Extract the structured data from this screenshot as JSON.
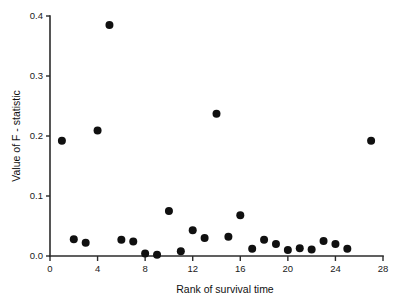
{
  "chart_data": {
    "type": "scatter",
    "title": "",
    "xlabel": "Rank of survival time",
    "ylabel": "Value of F - statistic",
    "xlim": [
      0,
      28
    ],
    "ylim": [
      0.0,
      0.4
    ],
    "xticks": [
      0,
      4,
      8,
      12,
      16,
      20,
      24,
      28
    ],
    "xtick_labels": [
      "0",
      "4",
      "8",
      "12",
      "16",
      "20",
      "24",
      "28"
    ],
    "yticks": [
      0.0,
      0.1,
      0.2,
      0.3,
      0.4
    ],
    "ytick_labels": [
      "0.0",
      "0.1",
      "0.2",
      "0.3",
      "0.4"
    ],
    "grid": false,
    "legend": false,
    "marker": "filled-circle",
    "marker_color": "#101010",
    "marker_size": 4,
    "x": [
      1,
      2,
      3,
      4,
      5,
      6,
      7,
      8,
      9,
      10,
      11,
      12,
      13,
      14,
      15,
      16,
      17,
      18,
      19,
      20,
      21,
      22,
      23,
      24,
      25,
      27
    ],
    "y": [
      0.192,
      0.028,
      0.022,
      0.209,
      0.385,
      0.027,
      0.024,
      0.004,
      0.002,
      0.075,
      0.008,
      0.043,
      0.03,
      0.237,
      0.032,
      0.068,
      0.012,
      0.027,
      0.02,
      0.01,
      0.013,
      0.011,
      0.025,
      0.02,
      0.012,
      0.192
    ],
    "points": [
      {
        "x": 1,
        "y": 0.192
      },
      {
        "x": 2,
        "y": 0.028
      },
      {
        "x": 3,
        "y": 0.022
      },
      {
        "x": 4,
        "y": 0.209
      },
      {
        "x": 5,
        "y": 0.385
      },
      {
        "x": 6,
        "y": 0.027
      },
      {
        "x": 7,
        "y": 0.024
      },
      {
        "x": 8,
        "y": 0.004
      },
      {
        "x": 9,
        "y": 0.002
      },
      {
        "x": 10,
        "y": 0.075
      },
      {
        "x": 11,
        "y": 0.008
      },
      {
        "x": 12,
        "y": 0.043
      },
      {
        "x": 13,
        "y": 0.03
      },
      {
        "x": 14,
        "y": 0.237
      },
      {
        "x": 15,
        "y": 0.032
      },
      {
        "x": 16,
        "y": 0.068
      },
      {
        "x": 17,
        "y": 0.012
      },
      {
        "x": 18,
        "y": 0.027
      },
      {
        "x": 19,
        "y": 0.02
      },
      {
        "x": 20,
        "y": 0.01
      },
      {
        "x": 21,
        "y": 0.013
      },
      {
        "x": 22,
        "y": 0.011
      },
      {
        "x": 23,
        "y": 0.025
      },
      {
        "x": 24,
        "y": 0.02
      },
      {
        "x": 25,
        "y": 0.012
      },
      {
        "x": 27,
        "y": 0.192
      }
    ]
  }
}
